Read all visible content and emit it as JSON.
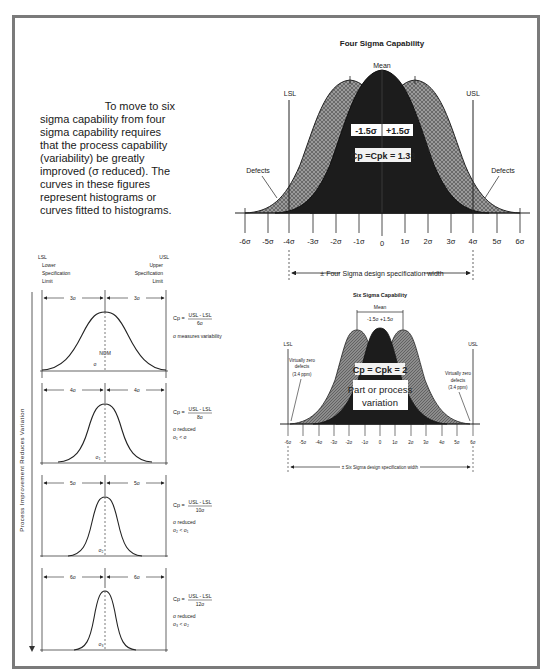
{
  "intro_text": {
    "first_line": "To move to six",
    "rest": "sigma capability from four sigma capability requires that the process capability (variability) be greatly improved (σ reduced). The curves in these figures represent histograms or curves fitted to histograms."
  },
  "four_sigma": {
    "title": "Four Sigma Capability",
    "mean_label": "Mean",
    "lsl_label": "LSL",
    "usl_label": "USL",
    "shift_minus": "-1.5σ",
    "shift_plus": "+1.5σ",
    "cp_label": "Cp =Cpk = 1.33",
    "defects_left": "Defects",
    "defects_right": "Defects",
    "spec_width_label": "± Four Sigma design specification width",
    "ticks": [
      "-6σ",
      "-5σ",
      "-4σ",
      "-3σ",
      "-2σ",
      "-1σ",
      "0",
      "1σ",
      "2σ",
      "3σ",
      "4σ",
      "5σ",
      "6σ"
    ]
  },
  "six_sigma": {
    "title": "Six Sigma Capability",
    "mean_label": "Mean",
    "shift_label": "-1.5σ +1.5σ",
    "lsl_label": "LSL",
    "usl_label": "USL",
    "cp_label": "Cp = Cpk = 2",
    "variation_line1": "Part or process",
    "variation_line2": "variation",
    "defects_left_1": "Virtually zero",
    "defects_left_2": "defects",
    "defects_left_3": "(3.4 ppm)",
    "defects_right_1": "Virtually zero",
    "defects_right_2": "defects",
    "defects_right_3": "(3.4 ppm)",
    "spec_width_label": "± Six Sigma design specification width",
    "ticks": [
      "-6σ",
      "-5σ",
      "-4σ",
      "-3σ",
      "-2σ",
      "-1σ",
      "0",
      "1σ",
      "2σ",
      "3σ",
      "4σ",
      "5σ",
      "6σ"
    ]
  },
  "left_panels": {
    "lsl": "LSL",
    "lsl_desc_1": "Lower",
    "lsl_desc_2": "Specification",
    "lsl_desc_3": "Limit",
    "usl": "USL",
    "usl_desc_1": "Upper",
    "usl_desc_2": "Specification",
    "usl_desc_3": "Limit",
    "vertical_label": "Process Improvement Reduces Variation",
    "nom_label": "NOM",
    "panels": [
      {
        "half_width": "3σ",
        "formula_num": "USL - LSL",
        "formula_den": "6σ",
        "note1": "σ measures variability",
        "note2": "",
        "sigma_mark": "σ"
      },
      {
        "half_width": "4σ",
        "formula_num": "USL - LSL",
        "formula_den": "8σ",
        "note1": "σ reduced",
        "note2": "σ₁ < σ",
        "sigma_mark": "σ₁"
      },
      {
        "half_width": "5σ",
        "formula_num": "USL - LSL",
        "formula_den": "10σ",
        "note1": "σ reduced",
        "note2": "σ₂ < σ₁",
        "sigma_mark": "σ₂"
      },
      {
        "half_width": "6σ",
        "formula_num": "USL - LSL",
        "formula_den": "12σ",
        "note1": "σ reduced",
        "note2": "σ₃ < σ₂",
        "sigma_mark": "σ₃"
      }
    ],
    "cp_prefix": "Cp ="
  }
}
